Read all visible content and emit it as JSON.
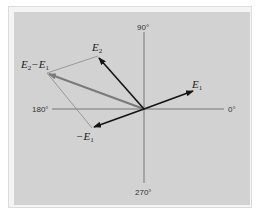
{
  "diagram": {
    "type": "phasor-vector-diagram",
    "axes": {
      "labels": {
        "deg_0": "0°",
        "deg_90": "90°",
        "deg_180": "180°",
        "deg_270": "270°"
      }
    },
    "vectors": {
      "e1": {
        "base": "E",
        "sub": "1",
        "prefix": ""
      },
      "e2": {
        "base": "E",
        "sub": "2",
        "prefix": ""
      },
      "neg_e1": {
        "base": "E",
        "sub": "1",
        "prefix": "−"
      },
      "diff": {
        "base1": "E",
        "sub1": "2",
        "minus": "−",
        "base2": "E",
        "sub2": "1"
      }
    },
    "colors": {
      "background": "#d2d2d2",
      "axis": "#6e6e6e",
      "vector": "#141414",
      "difference_vector": "#7a7a7a",
      "construction_line": "#8a8a8a"
    }
  }
}
